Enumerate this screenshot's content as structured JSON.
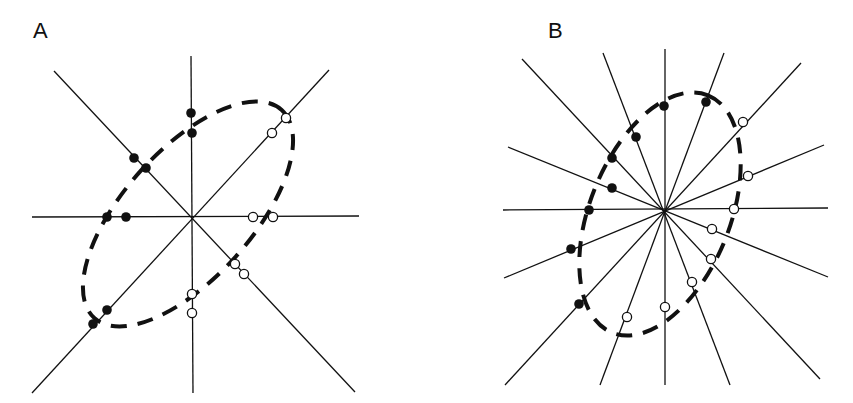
{
  "panels": [
    {
      "label": "A",
      "label_pos": [
        33,
        18
      ],
      "center": [
        192,
        216
      ],
      "lines": [
        [
          191,
          56,
          193,
          393
        ],
        [
          32,
          217,
          359,
          216
        ],
        [
          54,
          71,
          355,
          392
        ],
        [
          329,
          70,
          32,
          393
        ]
      ],
      "filled_dots": [
        [
          191,
          113
        ],
        [
          192,
          133
        ],
        [
          134,
          158
        ],
        [
          146,
          168
        ],
        [
          107,
          217
        ],
        [
          126,
          217
        ],
        [
          107,
          310
        ],
        [
          93,
          324
        ]
      ],
      "open_dots": [
        [
          272,
          133
        ],
        [
          286,
          118
        ],
        [
          253,
          217
        ],
        [
          273,
          217
        ],
        [
          235,
          264
        ],
        [
          244,
          274
        ],
        [
          192,
          294
        ],
        [
          192,
          313
        ]
      ],
      "ellipse": {
        "cx": 188,
        "cy": 214,
        "rx": 140,
        "ry": 64,
        "rotate": -48
      }
    },
    {
      "label": "B",
      "label_pos": [
        548,
        18
      ],
      "center": [
        664,
        210
      ],
      "lines": [
        [
          665,
          49,
          665,
          385
        ],
        [
          503,
          210,
          828,
          208
        ],
        [
          522,
          59,
          820,
          379
        ],
        [
          603,
          53,
          730,
          385
        ],
        [
          724,
          53,
          600,
          385
        ],
        [
          801,
          63,
          505,
          385
        ],
        [
          508,
          147,
          828,
          277
        ],
        [
          824,
          145,
          504,
          278
        ]
      ],
      "filled_dots": [
        [
          664,
          106
        ],
        [
          706,
          102
        ],
        [
          636,
          137
        ],
        [
          612,
          158
        ],
        [
          612,
          188
        ],
        [
          589,
          210
        ],
        [
          571,
          249
        ],
        [
          579,
          304
        ]
      ],
      "open_dots": [
        [
          743,
          122
        ],
        [
          748,
          176
        ],
        [
          734,
          209
        ],
        [
          712,
          229
        ],
        [
          711,
          259
        ],
        [
          692,
          282
        ],
        [
          665,
          307
        ],
        [
          627,
          317
        ]
      ],
      "ellipse": {
        "cx": 660,
        "cy": 214,
        "rx": 128,
        "ry": 70,
        "rotate": -68
      }
    }
  ]
}
